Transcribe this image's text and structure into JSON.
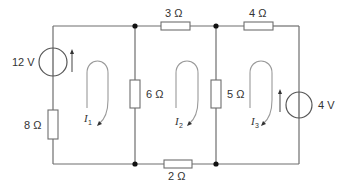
{
  "diagram": {
    "type": "circuit",
    "sources": [
      {
        "id": "V1",
        "label": "12 V",
        "branch": "left"
      },
      {
        "id": "V2",
        "label": "4 V",
        "branch": "right"
      }
    ],
    "resistors": [
      {
        "id": "R1",
        "label": "8 Ω",
        "branch": "left"
      },
      {
        "id": "R2",
        "label": "6 Ω",
        "branch": "middle-left"
      },
      {
        "id": "R3",
        "label": "3 Ω",
        "branch": "top-middle"
      },
      {
        "id": "R4",
        "label": "5 Ω",
        "branch": "middle-right"
      },
      {
        "id": "R5",
        "label": "4 Ω",
        "branch": "top-right"
      },
      {
        "id": "R6",
        "label": "2 Ω",
        "branch": "bottom-middle"
      }
    ],
    "mesh_currents": [
      {
        "symbol": "I",
        "subscript": "1",
        "direction": "clockwise"
      },
      {
        "symbol": "I",
        "subscript": "2",
        "direction": "clockwise"
      },
      {
        "symbol": "I",
        "subscript": "3",
        "direction": "clockwise"
      }
    ]
  }
}
